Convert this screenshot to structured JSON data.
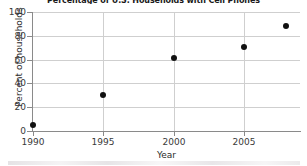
{
  "chart_data": {
    "type": "scatter",
    "title": "Percentage of U.S. Households with Cell Phones",
    "xlabel": "Year",
    "ylabel": "Percent of households",
    "xlim": [
      1990,
      2009
    ],
    "ylim": [
      0,
      100
    ],
    "xticks": [
      "1990",
      "1995",
      "2000",
      "2005"
    ],
    "xtick_values": [
      1990,
      1995,
      2000,
      2005
    ],
    "yticks": [
      "0",
      "20",
      "40",
      "60",
      "80",
      "100"
    ],
    "ytick_values": [
      0,
      20,
      40,
      60,
      80,
      100
    ],
    "grid": "horizontal-and-vertical",
    "legend": "none",
    "marker": "filled-circle",
    "marker_color": "#111111",
    "grid_color": "#cfcfcf",
    "axis_color": "#8a8a8a",
    "x": [
      1990,
      1995,
      2000,
      2005,
      2008
    ],
    "values": [
      5,
      30,
      61,
      71,
      88
    ],
    "points": [
      {
        "x": 1990,
        "y": 5
      },
      {
        "x": 1995,
        "y": 30
      },
      {
        "x": 2000,
        "y": 61
      },
      {
        "x": 2005,
        "y": 71
      },
      {
        "x": 2008,
        "y": 88
      }
    ]
  }
}
